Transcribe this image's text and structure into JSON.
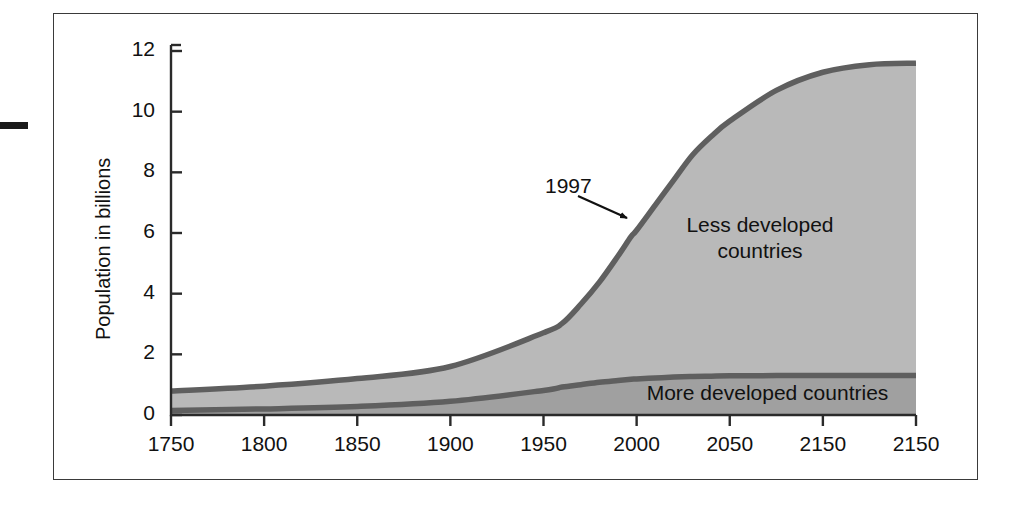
{
  "chart_data": {
    "type": "area",
    "title": "",
    "subtitle": "",
    "xlabel": "",
    "ylabel": "Population in billions",
    "xlim": [
      1750,
      2150
    ],
    "ylim": [
      0,
      12
    ],
    "grid": false,
    "legend_position": "inline-labels",
    "stacked": true,
    "x_ticks": [
      "1750",
      "1800",
      "1850",
      "1900",
      "1950",
      "2000",
      "2050",
      "2150",
      "2150"
    ],
    "x_tick_values": [
      1750,
      1800,
      1850,
      1900,
      1950,
      2000,
      2050,
      2100,
      2150
    ],
    "y_ticks": [
      "0",
      "2",
      "4",
      "6",
      "8",
      "10",
      "12"
    ],
    "y_tick_values": [
      0,
      2,
      4,
      6,
      8,
      10,
      12
    ],
    "x": [
      1750,
      1800,
      1850,
      1900,
      1950,
      1960,
      1970,
      1980,
      1990,
      1997,
      2000,
      2010,
      2020,
      2030,
      2040,
      2050,
      2075,
      2100,
      2125,
      2150
    ],
    "series": [
      {
        "name": "More developed countries",
        "values": [
          0.15,
          0.2,
          0.28,
          0.45,
          0.81,
          0.92,
          1.0,
          1.08,
          1.14,
          1.18,
          1.19,
          1.22,
          1.25,
          1.27,
          1.28,
          1.29,
          1.3,
          1.3,
          1.3,
          1.3
        ]
      },
      {
        "name": "Less developed countries",
        "values": [
          0.64,
          0.75,
          0.92,
          1.15,
          1.9,
          2.1,
          2.65,
          3.3,
          4.1,
          4.7,
          4.9,
          5.7,
          6.5,
          7.3,
          7.9,
          8.4,
          9.4,
          10.0,
          10.25,
          10.3
        ]
      }
    ],
    "totals": [
      0.79,
      0.95,
      1.2,
      1.6,
      2.71,
      3.02,
      3.65,
      4.38,
      5.24,
      5.88,
      6.09,
      6.92,
      7.75,
      8.57,
      9.18,
      9.69,
      10.7,
      11.3,
      11.55,
      11.6
    ],
    "annotations": [
      {
        "label": "1997",
        "x": 1997,
        "y": 5.9,
        "note": "arrow points to total population curve"
      }
    ],
    "colors": {
      "less_developed_fill": "#b9b9b9",
      "more_developed_fill": "#a0a0a0",
      "curve_stroke": "#5f5f5f",
      "axis": "#2a2a2a",
      "text": "#111111",
      "background": "#ffffff"
    }
  },
  "labels": {
    "y_axis_title": "Population in billions",
    "less_developed": "Less developed\ncountries",
    "more_developed": "More developed countries",
    "annotation_year": "1997"
  }
}
